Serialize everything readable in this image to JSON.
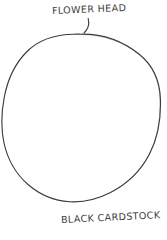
{
  "sketch": {
    "title": "Hand-drawn flower head template sketch",
    "background_color": "#ffffff",
    "ink_color": "#3b3b3b",
    "medium": "pencil on white paper"
  },
  "annotations": {
    "top_label": {
      "text": "FLOWER HEAD",
      "icon": "handwritten-text"
    },
    "bottom_label": {
      "text": "BLACK CARDSTOCK",
      "icon": "handwritten-text"
    }
  },
  "shapes": {
    "circle": {
      "name": "cardstock-circle",
      "center_x": 81,
      "center_y": 118,
      "radius_x": 79,
      "radius_y": 84,
      "stroke_color": "#3b3b3b",
      "stroke_width": 1.1,
      "fill": "none"
    },
    "leader_line": {
      "name": "flower-head-leader-line",
      "stroke_color": "#3b3b3b",
      "stroke_width": 1.1,
      "from_x": 88,
      "from_y": 19,
      "to_x": 84,
      "to_y": 33
    }
  }
}
